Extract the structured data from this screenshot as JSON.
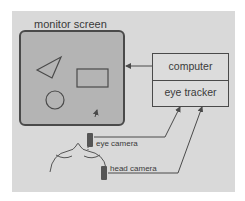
{
  "diagram": {
    "nodes": {
      "monitor": {
        "label": "monitor screen"
      },
      "computer": {
        "label": "computer"
      },
      "eye_tracker": {
        "label": "eye tracker"
      },
      "eye_camera": {
        "label": "eye camera"
      },
      "head_camera": {
        "label": "head camera"
      }
    },
    "monitor_shapes": [
      "triangle",
      "rectangle",
      "circle",
      "gaze-pointer"
    ],
    "edges": [
      {
        "from": "computer",
        "to": "monitor"
      },
      {
        "from": "eye_camera",
        "to": "eye_tracker"
      },
      {
        "from": "head_camera",
        "to": "eye_tracker"
      }
    ],
    "colors": {
      "background": "#d9d9d9",
      "monitor_fill": "#b4b4b4",
      "stroke": "#4a4a4a",
      "text": "#3a3a3a"
    }
  }
}
